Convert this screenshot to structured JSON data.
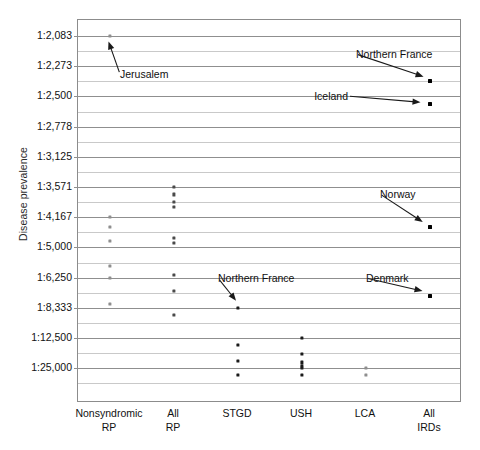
{
  "chart_data": {
    "type": "scatter",
    "title": "",
    "xlabel": "",
    "ylabel": "Disease prevalence",
    "grid": true,
    "legend": "none",
    "y_axis": {
      "note": "Disease prevalence expressed as 1:N ratios; axis is non-linear (evenly spaced ratio ticks, rarer toward bottom)",
      "tick_labels": [
        "1:2,083",
        "1:2,273",
        "1:2,500",
        "1:2,778",
        "1:3,125",
        "1:3,571",
        "1:4,167",
        "1:5,000",
        "1:6,250",
        "1:8,333",
        "1:12,500",
        "1:25,000"
      ],
      "tick_values": [
        2083,
        2273,
        2500,
        2778,
        3125,
        3571,
        4167,
        5000,
        6250,
        8333,
        12500,
        25000
      ],
      "minor_gridlines_between_ticks": 1
    },
    "categories": [
      "Nonsyndromic RP",
      "All RP",
      "STGD",
      "USH",
      "LCA",
      "All IRDs"
    ],
    "category_labels": [
      {
        "line1": "Nonsyndromic",
        "line2": "RP"
      },
      {
        "line1": "All",
        "line2": "RP"
      },
      {
        "line1": "STGD",
        "line2": ""
      },
      {
        "line1": "USH",
        "line2": ""
      },
      {
        "line1": "LCA",
        "line2": ""
      },
      {
        "line1": "All",
        "line2": "IRDs"
      }
    ],
    "series": [
      {
        "name": "Nonsyndromic RP",
        "category_index": 0,
        "points": [
          {
            "label": "Jerusalem",
            "ratio": 2083,
            "value_text": "1:2,083",
            "shade": "light"
          },
          {
            "label": "",
            "ratio": 4167,
            "value_text": "1:4,167",
            "shade": "light"
          },
          {
            "label": "",
            "ratio": 4400,
            "value_text": "~1:4,400",
            "shade": "light"
          },
          {
            "label": "",
            "ratio": 4800,
            "value_text": "~1:4,800",
            "shade": "light"
          },
          {
            "label": "",
            "ratio": 5700,
            "value_text": "~1:5,700",
            "shade": "light"
          },
          {
            "label": "",
            "ratio": 6250,
            "value_text": "1:6,250",
            "shade": "light"
          },
          {
            "label": "",
            "ratio": 8000,
            "value_text": "~1:8,000",
            "shade": "light"
          }
        ]
      },
      {
        "name": "All RP",
        "category_index": 1,
        "points": [
          {
            "label": "",
            "ratio": 3571,
            "value_text": "1:3,571",
            "shade": "mid"
          },
          {
            "label": "",
            "ratio": 3700,
            "value_text": "~1:3,700",
            "shade": "mid"
          },
          {
            "label": "",
            "ratio": 3850,
            "value_text": "~1:3,850",
            "shade": "mid"
          },
          {
            "label": "",
            "ratio": 3950,
            "value_text": "~1:3,950",
            "shade": "mid"
          },
          {
            "label": "",
            "ratio": 4700,
            "value_text": "~1:4,700",
            "shade": "mid"
          },
          {
            "label": "",
            "ratio": 4850,
            "value_text": "~1:4,850",
            "shade": "mid"
          },
          {
            "label": "",
            "ratio": 6100,
            "value_text": "~1:6,100",
            "shade": "mid"
          },
          {
            "label": "",
            "ratio": 7000,
            "value_text": "~1:7,000",
            "shade": "mid"
          },
          {
            "label": "",
            "ratio": 9000,
            "value_text": "~1:9,000",
            "shade": "mid"
          }
        ]
      },
      {
        "name": "STGD",
        "category_index": 2,
        "points": [
          {
            "label": "Northern France",
            "ratio": 8333,
            "value_text": "1:8,333",
            "shade": "dark"
          },
          {
            "label": "",
            "ratio": 14000,
            "value_text": "~1:14,000",
            "shade": "dark"
          },
          {
            "label": "",
            "ratio": 20000,
            "value_text": "~1:20,000",
            "shade": "dark"
          },
          {
            "label": "",
            "ratio": 32000,
            "value_text": "~1:32,000",
            "shade": "dark"
          }
        ]
      },
      {
        "name": "USH",
        "category_index": 3,
        "points": [
          {
            "label": "",
            "ratio": 12500,
            "value_text": "1:12,500",
            "shade": "dark"
          },
          {
            "label": "",
            "ratio": 17000,
            "value_text": "~1:17,000",
            "shade": "dark"
          },
          {
            "label": "",
            "ratio": 21000,
            "value_text": "~1:21,000",
            "shade": "dark"
          },
          {
            "label": "",
            "ratio": 23000,
            "value_text": "~1:23,000",
            "shade": "dark"
          },
          {
            "label": "",
            "ratio": 25000,
            "value_text": "1:25,000",
            "shade": "dark"
          },
          {
            "label": "",
            "ratio": 32000,
            "value_text": "~1:32,000",
            "shade": "dark"
          }
        ]
      },
      {
        "name": "LCA",
        "category_index": 4,
        "points": [
          {
            "label": "",
            "ratio": 25000,
            "value_text": "1:25,000",
            "shade": "light"
          },
          {
            "label": "",
            "ratio": 32000,
            "value_text": "~1:32,000",
            "shade": "light"
          }
        ]
      },
      {
        "name": "All IRDs",
        "category_index": 5,
        "points": [
          {
            "label": "Northern France",
            "ratio": 2380,
            "value_text": "~1:2,380",
            "shade": "big"
          },
          {
            "label": "Iceland",
            "ratio": 2560,
            "value_text": "~1:2,560",
            "shade": "big"
          },
          {
            "label": "Norway",
            "ratio": 4400,
            "value_text": "~1:4,400",
            "shade": "big"
          },
          {
            "label": "Denmark",
            "ratio": 7400,
            "value_text": "~1:7,400",
            "shade": "big"
          }
        ]
      }
    ],
    "annotations": [
      {
        "text": "Jerusalem",
        "target": "Nonsyndromic RP / 1:2,083"
      },
      {
        "text": "Northern France",
        "target": "All IRDs / ~1:2,380"
      },
      {
        "text": "Iceland",
        "target": "All IRDs / ~1:2,560"
      },
      {
        "text": "Norway",
        "target": "All IRDs / ~1:4,400"
      },
      {
        "text": "Northern France",
        "target": "STGD / 1:8,333"
      },
      {
        "text": "Denmark",
        "target": "All IRDs / ~1:7,400"
      }
    ],
    "colors": {
      "point_dark": "#1a1a1a",
      "point_mid": "#4a4a4a",
      "point_light": "#8e8e8e",
      "gridline_major": "#8f8f8f",
      "gridline_minor": "#c9c9c9",
      "frame": "#8c8c8c",
      "text": "#111111"
    }
  }
}
